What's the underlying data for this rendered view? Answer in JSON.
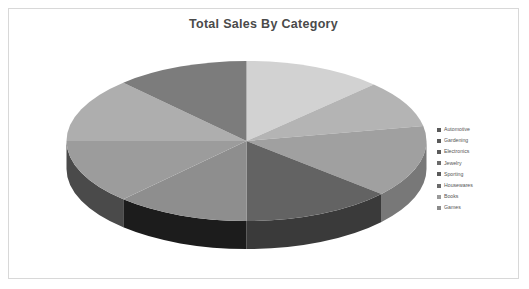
{
  "chart_data": {
    "type": "pie",
    "title": "Total Sales By Category",
    "xlabel": "",
    "ylabel": "",
    "legend_position": "right",
    "grid": false,
    "three_d": true,
    "start_angle_deg": 0,
    "direction": "clockwise",
    "categories": [
      "Automotive",
      "Gardening",
      "Electronics",
      "Jewelry",
      "Sporting",
      "Housewares",
      "Books",
      "Games"
    ],
    "values": [
      12.5,
      9.5,
      14.5,
      13.5,
      12.0,
      13.0,
      13.0,
      12.0
    ],
    "colors": [
      "#d2d2d2",
      "#b4b4b4",
      "#a0a0a0",
      "#8e8e8e",
      "#9a9a9a",
      "#a8a8a8",
      "#8a8a8a",
      "#7e7e7e"
    ],
    "slices": [
      {
        "label": "Automotive",
        "value": 12.5,
        "color": "#d2d2d2",
        "side_color": "#9e9e9e"
      },
      {
        "label": "Gardening",
        "value": 9.5,
        "color": "#b4b4b4",
        "side_color": "#868686"
      },
      {
        "label": "Electronics",
        "value": 14.5,
        "color": "#a0a0a0",
        "side_color": "#787878"
      },
      {
        "label": "Jewelry",
        "value": 13.5,
        "color": "#636363",
        "side_color": "#3a3a3a"
      },
      {
        "label": "Sporting",
        "value": 12.0,
        "color": "#8e8e8e",
        "side_color": "#1c1c1c"
      },
      {
        "label": "Housewares",
        "value": 13.0,
        "color": "#9c9c9c",
        "side_color": "#4a4a4a"
      },
      {
        "label": "Books",
        "value": 13.0,
        "color": "#aeaeae",
        "side_color": "#6e6e6e"
      },
      {
        "label": "Games",
        "value": 12.0,
        "color": "#7c7c7c",
        "side_color": "#5c5c5c"
      }
    ]
  },
  "legend": {
    "items": [
      {
        "label": "Automotive",
        "color": "#5a5a5a"
      },
      {
        "label": "Gardening",
        "color": "#5a5a5a"
      },
      {
        "label": "Electronics",
        "color": "#5a5a5a"
      },
      {
        "label": "Jewelry",
        "color": "#6a6a6a"
      },
      {
        "label": "Sporting",
        "color": "#5a5a5a"
      },
      {
        "label": "Housewares",
        "color": "#6a6a6a"
      },
      {
        "label": "Books",
        "color": "#9a9a9a"
      },
      {
        "label": "Games",
        "color": "#8a8a8a"
      }
    ]
  }
}
